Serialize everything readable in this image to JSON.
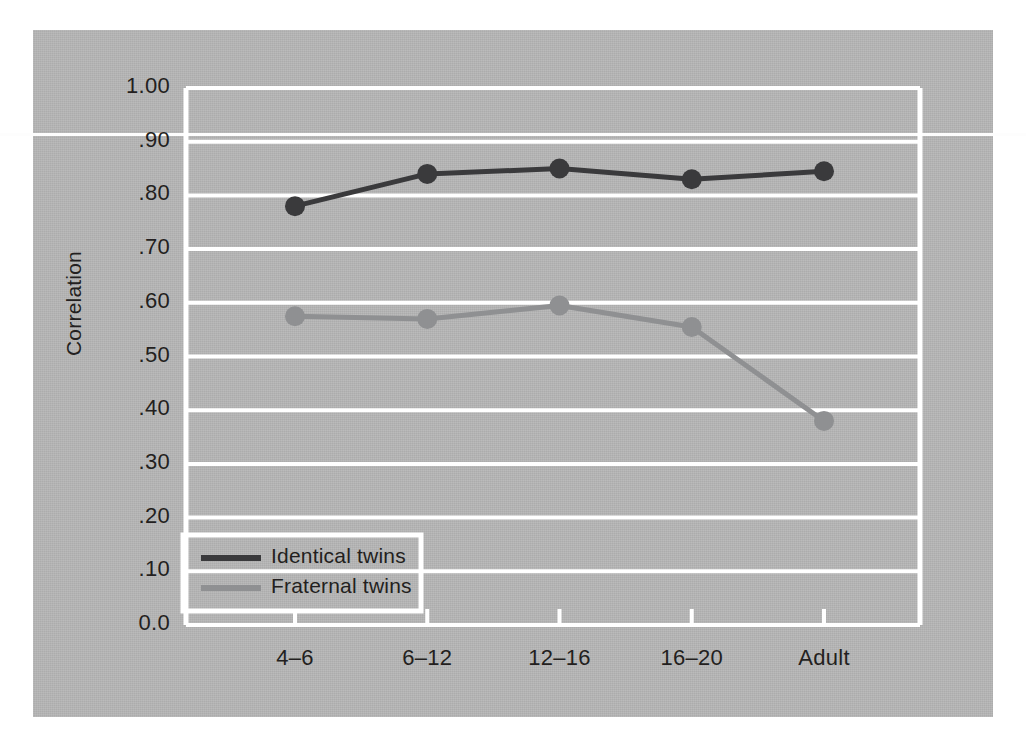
{
  "figure": {
    "plot_background": "#b4b4b4",
    "gridline_color": "#ffffff",
    "axis_title_y": "Correlation"
  },
  "legend": {
    "position": "bottom-left-inside",
    "entries": [
      {
        "label": "Identical twins",
        "color": "#3a3a3c",
        "swatch": "line-swatch-identical"
      },
      {
        "label": "Fraternal twins",
        "color": "#8f9092",
        "swatch": "line-swatch-fraternal"
      }
    ]
  },
  "chart_data": {
    "type": "line",
    "title": "",
    "xlabel": "",
    "ylabel": "Correlation",
    "categories": [
      "4–6",
      "6–12",
      "12–16",
      "16–20",
      "Adult"
    ],
    "ylim": [
      0.0,
      1.0
    ],
    "yticks": [
      0.0,
      0.1,
      0.2,
      0.3,
      0.4,
      0.5,
      0.6,
      0.7,
      0.8,
      0.9,
      1.0
    ],
    "ytick_labels": [
      "0.0",
      ".10",
      ".20",
      ".30",
      ".40",
      ".50",
      ".60",
      ".70",
      ".80",
      ".90",
      "1.00"
    ],
    "grid": true,
    "legend_position": "lower left",
    "series": [
      {
        "name": "Identical twins",
        "color": "#3a3a3c",
        "marker": "circle",
        "values": [
          0.78,
          0.84,
          0.85,
          0.83,
          0.845
        ]
      },
      {
        "name": "Fraternal twins",
        "color": "#8f9092",
        "marker": "circle",
        "values": [
          0.575,
          0.57,
          0.595,
          0.555,
          0.38
        ]
      }
    ]
  }
}
